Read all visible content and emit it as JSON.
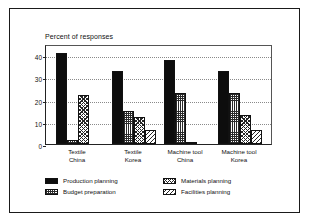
{
  "chart_data": {
    "type": "bar",
    "title": "Percent of responses",
    "xlabel": "",
    "ylabel": "",
    "ylim": [
      0,
      45
    ],
    "yticks": [
      0,
      10,
      20,
      30,
      40
    ],
    "ytick_labels": [
      "0",
      "10",
      "20",
      "30",
      "40"
    ],
    "grid": true,
    "legend_position": "bottom",
    "categories": [
      "Textile\nChina",
      "Textile\nKorea",
      "Machine tool\nChina",
      "Machine tool\nKorea"
    ],
    "category_lines": [
      [
        "Textile",
        "China"
      ],
      [
        "Textile",
        "Korea"
      ],
      [
        "Machine tool",
        "China"
      ],
      [
        "Machine tool",
        "Korea"
      ]
    ],
    "series": [
      {
        "name": "Production planning",
        "pattern": "solid-black",
        "values": [
          41,
          33,
          38,
          33
        ]
      },
      {
        "name": "Budget preparation",
        "pattern": "fine-grid",
        "values": [
          2,
          15,
          23,
          23
        ]
      },
      {
        "name": "Materials planning",
        "pattern": "cross-hatch",
        "values": [
          22,
          12,
          1,
          13
        ]
      },
      {
        "name": "Facilities planning",
        "pattern": "diagonal-hatch",
        "values": [
          0,
          6.5,
          0,
          6.5
        ]
      }
    ]
  },
  "legend": {
    "entries": [
      {
        "label": "Production planning",
        "pattern": "solid-black"
      },
      {
        "label": "Materials planning",
        "pattern": "cross-hatch"
      },
      {
        "label": "Budget preparation",
        "pattern": "fine-grid"
      },
      {
        "label": "Facilities planning",
        "pattern": "diagonal-hatch"
      }
    ]
  },
  "colors": {
    "ink": "#0d0d0d",
    "grid": "#8a8a8a",
    "background": "#ffffff",
    "frame": "#1a1a1a"
  }
}
